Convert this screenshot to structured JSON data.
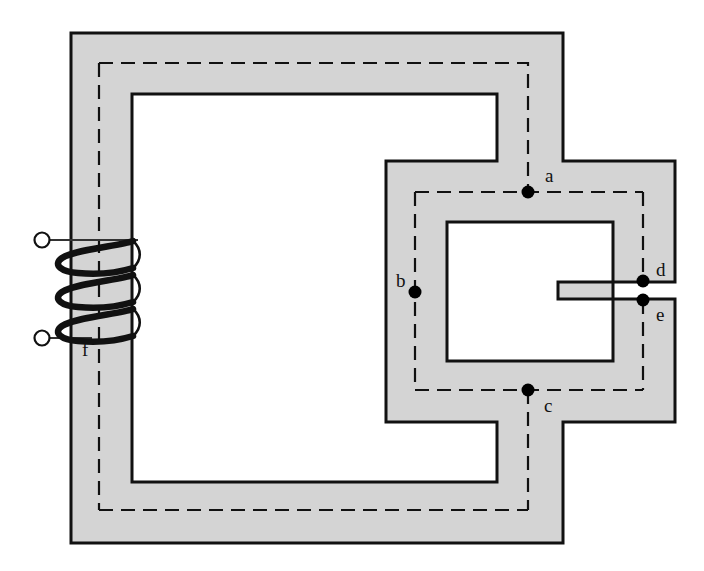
{
  "figure": {
    "kind": "magnetic-circuit-diagram",
    "title": "",
    "background_color": "#ffffff",
    "core_fill_color": "#d4d4d4",
    "core_stroke_color": "#111111",
    "flux_path_color": "#111111",
    "coil_color": "#111111",
    "node_marker_color": "#000000"
  },
  "core": {
    "name": "ferromagnetic-core",
    "outer_left": 71,
    "outer_top": 33,
    "outer_right": 563,
    "outer_bottom": 543,
    "limb_thickness": 61,
    "main_window": {
      "left": 132,
      "top": 94,
      "right": 497,
      "bottom": 482
    },
    "right_section": {
      "left": 386,
      "top": 161,
      "right": 675,
      "bottom": 422,
      "inner_window": {
        "left": 447,
        "top": 222,
        "right": 613,
        "bottom": 361
      }
    },
    "air_gap": {
      "name": "air-gap",
      "x": 643,
      "top_y": 282,
      "bottom_y": 299,
      "between": [
        "d",
        "e"
      ]
    }
  },
  "coil": {
    "name": "excitation-winding",
    "turns": 3,
    "limb": "left",
    "limb_left_x": 71,
    "limb_right_x": 132,
    "top_y": 240,
    "bottom_y": 345,
    "terminals": [
      {
        "name": "terminal-top",
        "cx": 42,
        "cy": 240,
        "r": 7
      },
      {
        "name": "terminal-bottom",
        "cx": 42,
        "cy": 338,
        "r": 7
      }
    ]
  },
  "flux_paths": {
    "dash_pattern": "14 8",
    "stroke_width": 2,
    "outer_loop": {
      "left": 99,
      "top": 63,
      "right": 528,
      "bottom": 510
    },
    "right_loop": {
      "left": 415,
      "top": 192,
      "right": 643,
      "bottom": 390
    }
  },
  "nodes": [
    {
      "id": "a",
      "label": "a",
      "x": 528,
      "y": 192,
      "label_x": 545,
      "label_y": 182,
      "radius": 6
    },
    {
      "id": "b",
      "label": "b",
      "x": 415,
      "y": 292,
      "label_x": 396,
      "label_y": 285,
      "radius": 6
    },
    {
      "id": "c",
      "label": "c",
      "x": 528,
      "y": 390,
      "label_x": 544,
      "label_y": 410,
      "radius": 6
    },
    {
      "id": "d",
      "label": "d",
      "x": 643,
      "y": 281,
      "label_x": 657,
      "label_y": 274,
      "radius": 6
    },
    {
      "id": "e",
      "label": "e",
      "x": 643,
      "y": 300,
      "label_x": 657,
      "label_y": 317,
      "radius": 6
    },
    {
      "id": "f",
      "label": "f",
      "x": 88,
      "y": 348,
      "label_x": 82,
      "label_y": 355,
      "radius": 0
    }
  ],
  "labels": {
    "a": "a",
    "b": "b",
    "c": "c",
    "d": "d",
    "e": "e",
    "f": "f"
  }
}
